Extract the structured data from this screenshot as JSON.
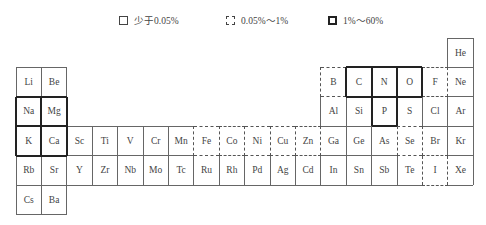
{
  "legend": [
    {
      "style": "plain",
      "label": "少于0.05%",
      "x": 119
    },
    {
      "style": "dashed",
      "label": "0.05%～1%",
      "x": 226
    },
    {
      "style": "thick",
      "label": "1%～60%",
      "x": 328
    }
  ],
  "grid": {
    "origin_x": 16,
    "origin_y": 38,
    "cell_w": 25.4,
    "cell_h": 29.4
  },
  "elements": [
    {
      "symbol": "He",
      "row": 0,
      "col": 17,
      "category": "plain"
    },
    {
      "symbol": "Li",
      "row": 1,
      "col": 0,
      "category": "plain"
    },
    {
      "symbol": "Be",
      "row": 1,
      "col": 1,
      "category": "plain"
    },
    {
      "symbol": "B",
      "row": 1,
      "col": 12,
      "category": "dashed"
    },
    {
      "symbol": "C",
      "row": 1,
      "col": 13,
      "category": "thick"
    },
    {
      "symbol": "N",
      "row": 1,
      "col": 14,
      "category": "thick"
    },
    {
      "symbol": "O",
      "row": 1,
      "col": 15,
      "category": "thick"
    },
    {
      "symbol": "F",
      "row": 1,
      "col": 16,
      "category": "dashed"
    },
    {
      "symbol": "Ne",
      "row": 1,
      "col": 17,
      "category": "plain"
    },
    {
      "symbol": "Na",
      "row": 2,
      "col": 0,
      "category": "thick"
    },
    {
      "symbol": "Mg",
      "row": 2,
      "col": 1,
      "category": "thick"
    },
    {
      "symbol": "Al",
      "row": 2,
      "col": 12,
      "category": "plain"
    },
    {
      "symbol": "Si",
      "row": 2,
      "col": 13,
      "category": "plain"
    },
    {
      "symbol": "P",
      "row": 2,
      "col": 14,
      "category": "thick"
    },
    {
      "symbol": "S",
      "row": 2,
      "col": 15,
      "category": "plain"
    },
    {
      "symbol": "Cl",
      "row": 2,
      "col": 16,
      "category": "plain"
    },
    {
      "symbol": "Ar",
      "row": 2,
      "col": 17,
      "category": "plain"
    },
    {
      "symbol": "K",
      "row": 3,
      "col": 0,
      "category": "thick"
    },
    {
      "symbol": "Ca",
      "row": 3,
      "col": 1,
      "category": "thick"
    },
    {
      "symbol": "Sc",
      "row": 3,
      "col": 2,
      "category": "plain"
    },
    {
      "symbol": "Ti",
      "row": 3,
      "col": 3,
      "category": "plain"
    },
    {
      "symbol": "V",
      "row": 3,
      "col": 4,
      "category": "plain"
    },
    {
      "symbol": "Cr",
      "row": 3,
      "col": 5,
      "category": "plain"
    },
    {
      "symbol": "Mn",
      "row": 3,
      "col": 6,
      "category": "plain"
    },
    {
      "symbol": "Fe",
      "row": 3,
      "col": 7,
      "category": "dashed"
    },
    {
      "symbol": "Co",
      "row": 3,
      "col": 8,
      "category": "dashed"
    },
    {
      "symbol": "Ni",
      "row": 3,
      "col": 9,
      "category": "dashed"
    },
    {
      "symbol": "Cu",
      "row": 3,
      "col": 10,
      "category": "dashed"
    },
    {
      "symbol": "Zn",
      "row": 3,
      "col": 11,
      "category": "dashed"
    },
    {
      "symbol": "Ga",
      "row": 3,
      "col": 12,
      "category": "plain"
    },
    {
      "symbol": "Ge",
      "row": 3,
      "col": 13,
      "category": "plain"
    },
    {
      "symbol": "As",
      "row": 3,
      "col": 14,
      "category": "plain"
    },
    {
      "symbol": "Se",
      "row": 3,
      "col": 15,
      "category": "dashed"
    },
    {
      "symbol": "Br",
      "row": 3,
      "col": 16,
      "category": "plain"
    },
    {
      "symbol": "Kr",
      "row": 3,
      "col": 17,
      "category": "plain"
    },
    {
      "symbol": "Rb",
      "row": 4,
      "col": 0,
      "category": "plain"
    },
    {
      "symbol": "Sr",
      "row": 4,
      "col": 1,
      "category": "plain"
    },
    {
      "symbol": "Y",
      "row": 4,
      "col": 2,
      "category": "plain"
    },
    {
      "symbol": "Zr",
      "row": 4,
      "col": 3,
      "category": "plain"
    },
    {
      "symbol": "Nb",
      "row": 4,
      "col": 4,
      "category": "plain"
    },
    {
      "symbol": "Mo",
      "row": 4,
      "col": 5,
      "category": "plain"
    },
    {
      "symbol": "Tc",
      "row": 4,
      "col": 6,
      "category": "plain"
    },
    {
      "symbol": "Ru",
      "row": 4,
      "col": 7,
      "category": "plain"
    },
    {
      "symbol": "Rh",
      "row": 4,
      "col": 8,
      "category": "plain"
    },
    {
      "symbol": "Pd",
      "row": 4,
      "col": 9,
      "category": "plain"
    },
    {
      "symbol": "Ag",
      "row": 4,
      "col": 10,
      "category": "plain"
    },
    {
      "symbol": "Cd",
      "row": 4,
      "col": 11,
      "category": "plain"
    },
    {
      "symbol": "In",
      "row": 4,
      "col": 12,
      "category": "plain"
    },
    {
      "symbol": "Sn",
      "row": 4,
      "col": 13,
      "category": "plain"
    },
    {
      "symbol": "Sb",
      "row": 4,
      "col": 14,
      "category": "plain"
    },
    {
      "symbol": "Te",
      "row": 4,
      "col": 15,
      "category": "plain"
    },
    {
      "symbol": "I",
      "row": 4,
      "col": 16,
      "category": "dashed"
    },
    {
      "symbol": "Xe",
      "row": 4,
      "col": 17,
      "category": "plain"
    },
    {
      "symbol": "Cs",
      "row": 5,
      "col": 0,
      "category": "plain"
    },
    {
      "symbol": "Ba",
      "row": 5,
      "col": 1,
      "category": "plain"
    }
  ],
  "colors": {
    "line": "#666666",
    "thick": "#222222",
    "dashed": "#555555",
    "text": "#444444"
  }
}
